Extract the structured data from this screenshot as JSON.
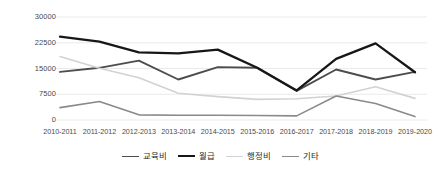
{
  "chart_data": {
    "type": "line",
    "title": "",
    "xlabel": "",
    "ylabel": "",
    "categories": [
      "2010-2011",
      "2011-2012",
      "2012-2013",
      "2013-2014",
      "2014-2015",
      "2015-2016",
      "2016-2017",
      "2017-2018",
      "2018-2019",
      "2019-2020"
    ],
    "yticks": [
      "0",
      "7500",
      "15000",
      "22500",
      "30000"
    ],
    "ylim": [
      0,
      30000
    ],
    "grid": true,
    "legend_position": "bottom",
    "series": [
      {
        "name": "교육비",
        "color": "#4d4d4d",
        "width": 1.9,
        "values": [
          14000,
          15200,
          17300,
          11800,
          15400,
          15200,
          8500,
          14700,
          11800,
          14000
        ]
      },
      {
        "name": "월급",
        "color": "#171717",
        "width": 2.3,
        "values": [
          24300,
          22800,
          19700,
          19400,
          20500,
          15200,
          8600,
          17800,
          22300,
          13900
        ]
      },
      {
        "name": "행정비",
        "color": "#d2d2d2",
        "width": 1.6,
        "values": [
          18500,
          15100,
          12300,
          7800,
          6800,
          6000,
          6200,
          7000,
          9700,
          6300
        ]
      },
      {
        "name": "기타",
        "color": "#8a8a8a",
        "width": 1.6,
        "values": [
          3600,
          5400,
          1500,
          1400,
          1400,
          1300,
          1200,
          7000,
          4800,
          1000
        ]
      }
    ]
  },
  "axes": {
    "gridline_color": "#e8e8e8",
    "tick_label_color": "#4a4a4a"
  }
}
